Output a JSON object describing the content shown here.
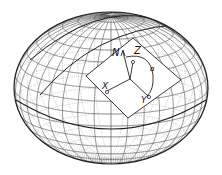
{
  "diagram": {
    "labels": {
      "north": "N",
      "zenith": "Z",
      "x_axis": "X",
      "y_axis": "Y",
      "angle": "α"
    },
    "colors": {
      "stroke": "#222222",
      "grid": "#555555",
      "grid_faint": "#9a9a9a",
      "plane_fill": "#ffffff",
      "background": "#ffffff"
    },
    "ellipsoid": {
      "cx": 111,
      "cy": 88,
      "rx": 97,
      "ry": 76
    }
  }
}
